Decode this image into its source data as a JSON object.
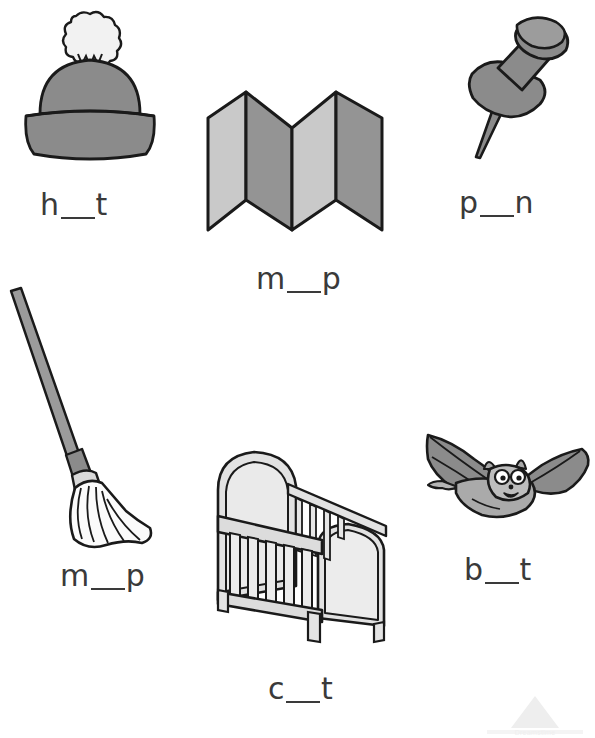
{
  "page": {
    "width": 595,
    "height": 738,
    "background": "#ffffff"
  },
  "colors": {
    "outline": "#1a1a1a",
    "text": "#3a3a3a",
    "gray_mid": "#8b8b8b",
    "gray_dark": "#7a7a7a",
    "gray_light": "#c9c9c9",
    "gray_lighter": "#e2e2e2",
    "near_white": "#f2f2f2",
    "watermark": "#efefef"
  },
  "items": [
    {
      "id": "hat",
      "picture_name": "knit-hat-illustration",
      "answer_word": "hat",
      "label": {
        "prefix": "h",
        "blank": "__",
        "suffix": "t"
      }
    },
    {
      "id": "map",
      "picture_name": "folded-map-illustration",
      "answer_word": "map",
      "label": {
        "prefix": "m",
        "blank": "__",
        "suffix": "p"
      }
    },
    {
      "id": "pin",
      "picture_name": "push-pin-illustration",
      "answer_word": "pin",
      "label": {
        "prefix": "p",
        "blank": "__",
        "suffix": "n"
      }
    },
    {
      "id": "mop",
      "picture_name": "mop-illustration",
      "answer_word": "mop",
      "label": {
        "prefix": "m",
        "blank": "__",
        "suffix": "p"
      }
    },
    {
      "id": "cot",
      "picture_name": "cot-crib-illustration",
      "answer_word": "cot",
      "label": {
        "prefix": "c",
        "blank": "__",
        "suffix": "t"
      }
    },
    {
      "id": "bat",
      "picture_name": "bat-animal-illustration",
      "answer_word": "bat",
      "label": {
        "prefix": "b",
        "blank": "__",
        "suffix": "t"
      }
    }
  ],
  "watermark": {
    "text": "Dreamstime",
    "shape": "triangle-logo"
  }
}
